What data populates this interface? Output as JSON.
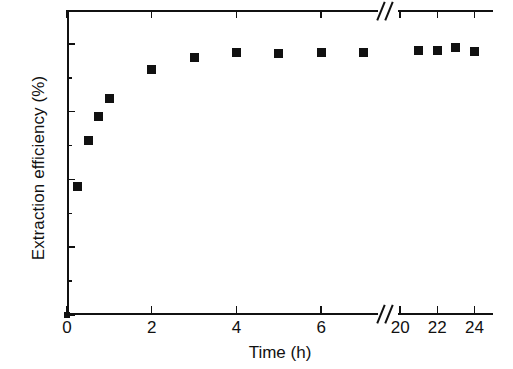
{
  "chart_data": {
    "type": "scatter",
    "title": "",
    "xlabel": "Time (h)",
    "ylabel": "Extraction efficiency (%)",
    "xlim": [
      0,
      25
    ],
    "ylim": [
      0,
      90
    ],
    "grid": false,
    "legend": null,
    "axis_break": {
      "axis": "x",
      "from": 7.6,
      "to": 19.4,
      "marker": "double-slash"
    },
    "x_ticks": [
      {
        "value": 0,
        "label": "0"
      },
      {
        "value": 2,
        "label": "2"
      },
      {
        "value": 4,
        "label": "4"
      },
      {
        "value": 6,
        "label": "6"
      },
      {
        "value": 20,
        "label": "20"
      },
      {
        "value": 22,
        "label": "22"
      },
      {
        "value": 24,
        "label": "24"
      }
    ],
    "y_ticks": [
      {
        "value": 0,
        "label": "0"
      },
      {
        "value": 20,
        "label": "20"
      },
      {
        "value": 40,
        "label": "40"
      },
      {
        "value": 60,
        "label": "60"
      },
      {
        "value": 80,
        "label": "80"
      }
    ],
    "y_minor_ticks": [
      10,
      30,
      50,
      70
    ],
    "marker_style": "filled-square",
    "marker_color": "#111111",
    "series": [
      {
        "name": "Extraction efficiency",
        "points": [
          {
            "x": 0,
            "y": 0
          },
          {
            "x": 0.25,
            "y": 38
          },
          {
            "x": 0.5,
            "y": 51.5
          },
          {
            "x": 0.75,
            "y": 58.5
          },
          {
            "x": 1,
            "y": 64
          },
          {
            "x": 2,
            "y": 72.5
          },
          {
            "x": 3,
            "y": 76
          },
          {
            "x": 4,
            "y": 77.5
          },
          {
            "x": 5,
            "y": 77.3
          },
          {
            "x": 6,
            "y": 77.5
          },
          {
            "x": 7,
            "y": 77.5
          },
          {
            "x": 21,
            "y": 78
          },
          {
            "x": 22,
            "y": 78
          },
          {
            "x": 23,
            "y": 78.8
          },
          {
            "x": 24,
            "y": 77.8
          }
        ]
      }
    ]
  }
}
